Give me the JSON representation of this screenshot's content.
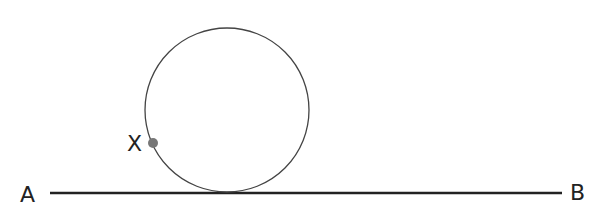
{
  "diagram": {
    "labels": {
      "A": "A",
      "B": "B",
      "X": "X"
    },
    "line": {
      "x1": 50,
      "y1": 193,
      "x2": 562,
      "y2": 193,
      "color": "#222222"
    },
    "circle": {
      "cx": 227,
      "cy": 110,
      "r": 82,
      "color": "#444444"
    },
    "point_x": {
      "cx": 153,
      "cy": 143,
      "r": 5,
      "color": "#777777"
    }
  }
}
